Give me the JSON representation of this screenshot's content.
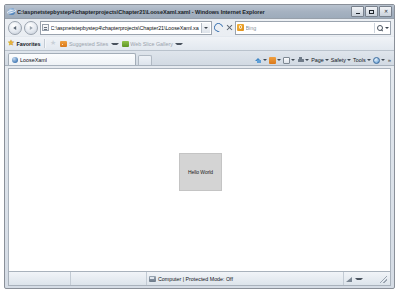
{
  "window": {
    "title": "C:\\aspnetstepbystep4\\chapterprojects\\Chapter21\\LooseXaml.xaml - Windows Internet Explorer",
    "app_icon": "ie-logo-icon",
    "controls": {
      "minimize": "—",
      "maximize": "❐",
      "close": "✕"
    }
  },
  "navigation": {
    "back_label": "Back",
    "forward_label": "Forward",
    "address_value": "C:\\aspnetstepbystep4\\chapterprojects\\Chapter21\\LooseXaml.xa",
    "address_icon": "page-icon",
    "address_dropdown": "chevron-down-icon",
    "refresh_label": "Refresh",
    "stop_label": "Stop",
    "search_placeholder": "Bing",
    "search_provider_icon": "bing-icon",
    "search_go_icon": "search-icon"
  },
  "favorites_bar": {
    "favorites_label": "Favorites",
    "add_to_favorites_icon": "star-outline-icon",
    "suggested_sites_label": "Suggested Sites",
    "suggested_sites_icon": "rss-icon",
    "web_slice_label": "Web Slice Gallery",
    "web_slice_icon": "web-slice-icon"
  },
  "tabs": {
    "active": "LooseXaml",
    "favicon": "page-favicon-icon",
    "new_tab_label": "New Tab"
  },
  "command_bar": {
    "items": [
      {
        "label": "",
        "icon": "home-icon",
        "has_caret": true
      },
      {
        "label": "",
        "icon": "feeds-icon",
        "has_caret": true
      },
      {
        "label": "",
        "icon": "read-mail-icon",
        "has_caret": true
      },
      {
        "label": "",
        "icon": "print-icon",
        "has_caret": true
      },
      {
        "label": "Page",
        "icon": "",
        "has_caret": true
      },
      {
        "label": "Safety",
        "icon": "",
        "has_caret": true
      },
      {
        "label": "Tools",
        "icon": "",
        "has_caret": true
      },
      {
        "label": "",
        "icon": "help-icon",
        "has_caret": true
      }
    ],
    "overflow_label": "»",
    "page_label": "Page",
    "safety_label": "Safety",
    "tools_label": "Tools"
  },
  "page_content": {
    "hello_box_text": "Hello World",
    "background_color": "#ffffff",
    "box_fill_color": "#d4d4d4",
    "box_border_color": "#c4c4c4"
  },
  "status_bar": {
    "left_text": "",
    "zone_text": "Computer | Protected Mode: Off",
    "zone_icon": "computer-zone-icon",
    "zoom_icon": "zoom-icon",
    "zoom_label": "",
    "resize_grip": "resize-grip-icon"
  }
}
